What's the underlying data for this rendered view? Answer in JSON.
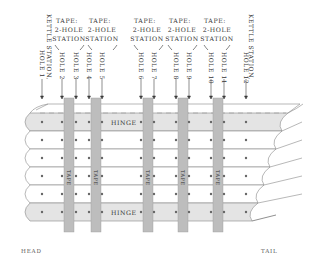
{
  "diagram": {
    "title_labels": {
      "kettle_left": "KETTLE STATION,",
      "kettle_right": "KETTLE STATION,",
      "tape_stations": [
        {
          "line1": "TAPE:",
          "line2": "2-HOLE",
          "line3": "STATION"
        },
        {
          "line1": "TAPE:",
          "line2": "2-HOLE",
          "line3": "STATION"
        },
        {
          "line1": "TAPE:",
          "line2": "2-HOLE",
          "line3": "STATION"
        },
        {
          "line1": "TAPE:",
          "line2": "2-HOLE",
          "line3": "STATION"
        },
        {
          "line1": "TAPE:",
          "line2": "2-HOLE",
          "line3": "STATION"
        }
      ]
    },
    "holes": [
      {
        "label": "HOLE 1",
        "x": 42
      },
      {
        "label": "HOLE 2",
        "x": 62
      },
      {
        "label": "HOLE 3",
        "x": 76
      },
      {
        "label": "HOLE 4",
        "x": 89
      },
      {
        "label": "HOLE 5",
        "x": 102
      },
      {
        "label": "HOLE 6",
        "x": 141
      },
      {
        "label": "HOLE 7",
        "x": 154
      },
      {
        "label": "HOLE 8",
        "x": 176
      },
      {
        "label": "HOLE 9",
        "x": 189
      },
      {
        "label": "HOLE 10",
        "x": 211
      },
      {
        "label": "HOLE 11",
        "x": 224
      },
      {
        "label": "HOLE 12",
        "x": 246
      }
    ],
    "tapes": [
      {
        "label": "TAPE",
        "x": 64
      },
      {
        "label": "TAPE",
        "x": 91
      },
      {
        "label": "TAPE",
        "x": 143
      },
      {
        "label": "TAPE",
        "x": 178
      },
      {
        "label": "TAPE",
        "x": 213
      }
    ],
    "hinge_labels": {
      "top": "HINGE",
      "bottom": "HINGE"
    },
    "end_labels": {
      "head": "HEAD",
      "tail": "TAIL"
    },
    "colors": {
      "hinge_fill": "#e4e4e4",
      "tape_fill": "#bdbdbd",
      "line": "#888888",
      "dot": "#666666"
    }
  }
}
